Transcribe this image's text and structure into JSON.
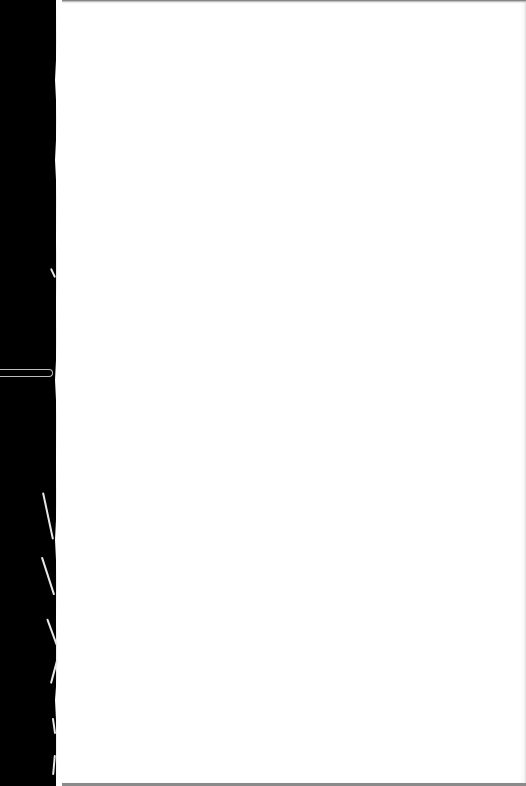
{
  "scene": {
    "description": "Blank white paper sheet photographed against a black background",
    "colors": {
      "background": "#000000",
      "paper": "#ffffff",
      "top_edge_shadow": "#6a6a6a",
      "tape_outline": "#bdbdbd"
    }
  }
}
